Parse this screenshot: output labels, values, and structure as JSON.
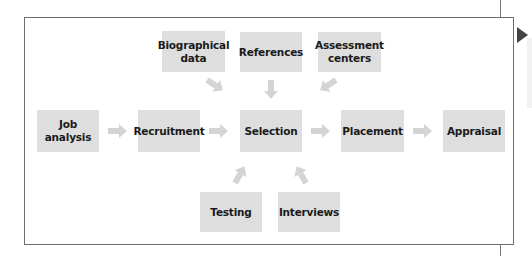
{
  "diagram": {
    "title": "",
    "colors": {
      "box_fill": "#dedede",
      "arrow_fill": "#d4d4d4",
      "frame_border": "#6e6e6e",
      "marker": "#444444"
    },
    "inputs_top": [
      {
        "id": "biographical-data",
        "label": "Biographical\ndata"
      },
      {
        "id": "references",
        "label": "References"
      },
      {
        "id": "assessment-centers",
        "label": "Assessment\ncenters"
      }
    ],
    "main_flow": [
      {
        "id": "job-analysis",
        "label": "Job\nanalysis"
      },
      {
        "id": "recruitment",
        "label": "Recruitment"
      },
      {
        "id": "selection",
        "label": "Selection"
      },
      {
        "id": "placement",
        "label": "Placement"
      },
      {
        "id": "appraisal",
        "label": "Appraisal"
      }
    ],
    "inputs_bottom": [
      {
        "id": "testing",
        "label": "Testing"
      },
      {
        "id": "interviews",
        "label": "Interviews"
      }
    ],
    "edges": [
      {
        "from": "job-analysis",
        "to": "recruitment"
      },
      {
        "from": "recruitment",
        "to": "selection"
      },
      {
        "from": "selection",
        "to": "placement"
      },
      {
        "from": "placement",
        "to": "appraisal"
      },
      {
        "from": "biographical-data",
        "to": "selection"
      },
      {
        "from": "references",
        "to": "selection"
      },
      {
        "from": "assessment-centers",
        "to": "selection"
      },
      {
        "from": "testing",
        "to": "selection"
      },
      {
        "from": "interviews",
        "to": "selection"
      }
    ]
  }
}
